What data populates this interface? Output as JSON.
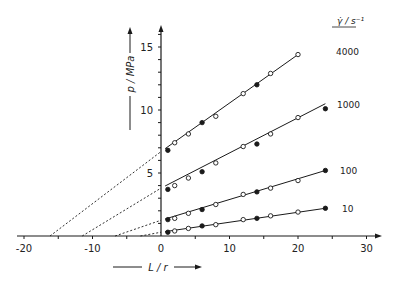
{
  "chart_data": {
    "type": "line",
    "title": "",
    "xlabel": "L / r",
    "ylabel": "p / MPa",
    "xlim": [
      -21,
      31
    ],
    "ylim": [
      0,
      17
    ],
    "x_ticks": [
      -20,
      -10,
      0,
      10,
      20,
      30
    ],
    "x_minor_step": 5,
    "y_ticks": [
      5,
      10,
      15
    ],
    "y_minor_step": 1,
    "grid": false,
    "legend_title": "γ̇ / s⁻¹",
    "legend_position": "right, labels at line ends",
    "marker_note": "alternating open and filled circles",
    "series": [
      {
        "name": "4000",
        "points": [
          {
            "x": 1,
            "y": 6.8,
            "filled": true
          },
          {
            "x": 2,
            "y": 7.4,
            "filled": false
          },
          {
            "x": 4,
            "y": 8.1,
            "filled": false
          },
          {
            "x": 6,
            "y": 9.0,
            "filled": true
          },
          {
            "x": 8,
            "y": 9.5,
            "filled": false
          },
          {
            "x": 12,
            "y": 11.3,
            "filled": false
          },
          {
            "x": 14,
            "y": 12.0,
            "filled": true
          },
          {
            "x": 16,
            "y": 12.9,
            "filled": false
          },
          {
            "x": 20,
            "y": 14.4,
            "filled": false
          }
        ],
        "fit_line": {
          "x0": 0,
          "y0": 6.7,
          "x1": 20,
          "y1": 14.4
        },
        "extrapolation_x_intercept": -16.2,
        "label_pos": {
          "x": 336,
          "y": 55
        }
      },
      {
        "name": "1000",
        "points": [
          {
            "x": 1,
            "y": 3.7,
            "filled": true
          },
          {
            "x": 2,
            "y": 4.0,
            "filled": false
          },
          {
            "x": 4,
            "y": 4.6,
            "filled": false
          },
          {
            "x": 6,
            "y": 5.1,
            "filled": true
          },
          {
            "x": 8,
            "y": 5.8,
            "filled": false
          },
          {
            "x": 12,
            "y": 7.1,
            "filled": false
          },
          {
            "x": 14,
            "y": 7.3,
            "filled": true
          },
          {
            "x": 16,
            "y": 8.1,
            "filled": false
          },
          {
            "x": 20,
            "y": 9.4,
            "filled": false
          },
          {
            "x": 24,
            "y": 10.1,
            "filled": true
          }
        ],
        "fit_line": {
          "x0": 0,
          "y0": 3.8,
          "x1": 24,
          "y1": 10.5
        },
        "extrapolation_x_intercept": -11.5,
        "label_pos": {
          "x": 337,
          "y": 108
        }
      },
      {
        "name": "100",
        "points": [
          {
            "x": 1,
            "y": 1.3,
            "filled": true
          },
          {
            "x": 2,
            "y": 1.4,
            "filled": false
          },
          {
            "x": 4,
            "y": 1.8,
            "filled": false
          },
          {
            "x": 6,
            "y": 2.1,
            "filled": true
          },
          {
            "x": 8,
            "y": 2.5,
            "filled": false
          },
          {
            "x": 12,
            "y": 3.3,
            "filled": false
          },
          {
            "x": 14,
            "y": 3.5,
            "filled": true
          },
          {
            "x": 16,
            "y": 3.8,
            "filled": false
          },
          {
            "x": 20,
            "y": 4.4,
            "filled": false
          },
          {
            "x": 24,
            "y": 5.2,
            "filled": true
          }
        ],
        "fit_line": {
          "x0": 0,
          "y0": 1.25,
          "x1": 24,
          "y1": 5.2
        },
        "extrapolation_x_intercept": -6.7,
        "label_pos": {
          "x": 340,
          "y": 174
        }
      },
      {
        "name": "10",
        "points": [
          {
            "x": 1,
            "y": 0.3,
            "filled": true
          },
          {
            "x": 2,
            "y": 0.4,
            "filled": false
          },
          {
            "x": 4,
            "y": 0.6,
            "filled": false
          },
          {
            "x": 6,
            "y": 0.8,
            "filled": true
          },
          {
            "x": 8,
            "y": 0.9,
            "filled": false
          },
          {
            "x": 12,
            "y": 1.3,
            "filled": false
          },
          {
            "x": 14,
            "y": 1.4,
            "filled": true
          },
          {
            "x": 16,
            "y": 1.6,
            "filled": false
          },
          {
            "x": 20,
            "y": 1.9,
            "filled": false
          },
          {
            "x": 24,
            "y": 2.2,
            "filled": true
          }
        ],
        "fit_line": {
          "x0": 0,
          "y0": 0.3,
          "x1": 24,
          "y1": 2.2
        },
        "extrapolation_x_intercept": -3.0,
        "label_pos": {
          "x": 342,
          "y": 212
        }
      }
    ]
  },
  "layout": {
    "origin_px": {
      "x": 161,
      "y": 236
    },
    "px_per_x": 6.85,
    "px_per_y": 12.6,
    "x_axis_px": [
      17,
      382
    ],
    "y_axis_top_px": 25,
    "ink_color": "#1a1a1a"
  },
  "labels": {
    "y_axis_title": "p / MPa",
    "x_axis_title": "L / r",
    "legend_title": "γ̇ / s⁻¹"
  }
}
